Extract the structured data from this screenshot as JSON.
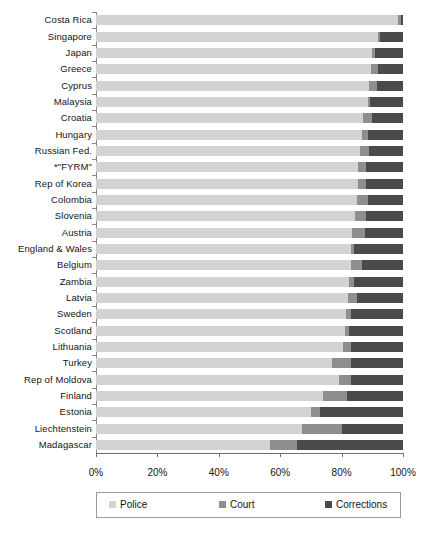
{
  "chart_data": {
    "type": "bar",
    "orientation": "horizontal",
    "stacked": true,
    "normalized": true,
    "title": "",
    "xlabel": "",
    "ylabel": "",
    "xlim": [
      0,
      100
    ],
    "grid": false,
    "legend_position": "bottom",
    "x_tick_labels": [
      "0%",
      "20%",
      "40%",
      "60%",
      "80%",
      "100%"
    ],
    "x_tick_values": [
      0,
      20,
      40,
      60,
      80,
      100
    ],
    "categories": [
      "Costa Rica",
      "Singapore",
      "Japan",
      "Greece",
      "Cyprus",
      "Malaysia",
      "Croatia",
      "Hungary",
      "Russian Fed.",
      "*\"FYRM\"",
      "Rep of Korea",
      "Colombia",
      "Slovenia",
      "Austria",
      "England & Wales",
      "Belgium",
      "Zambia",
      "Latvia",
      "Sweden",
      "Scotland",
      "Lithuania",
      "Turkey",
      "Rep of Moldova",
      "Finland",
      "Estonia",
      "Liechtenstein",
      "Madagascar"
    ],
    "series": [
      {
        "name": "Police",
        "color": "#d3d3d3",
        "values": [
          98.5,
          91.9,
          90.0,
          89.5,
          89.0,
          88.5,
          87.0,
          86.5,
          86.0,
          85.5,
          85.5,
          85.0,
          84.5,
          83.5,
          83.0,
          83.0,
          82.5,
          82.0,
          81.5,
          81.0,
          80.5,
          77.0,
          79.0,
          74.0,
          70.0,
          67.1,
          56.7
        ]
      },
      {
        "name": "Court",
        "color": "#8e8e8e",
        "values": [
          0.8,
          0.6,
          0.8,
          2.5,
          2.5,
          0.8,
          3.0,
          2.0,
          3.0,
          2.5,
          2.5,
          3.5,
          3.5,
          4.0,
          1.0,
          3.5,
          1.5,
          3.0,
          1.5,
          1.5,
          2.5,
          6.0,
          4.0,
          7.7,
          3.0,
          12.9,
          8.8
        ]
      },
      {
        "name": "Corrections",
        "color": "#4a4a4a",
        "values": [
          0.7,
          7.5,
          9.2,
          8.0,
          8.5,
          10.7,
          10.0,
          11.5,
          11.0,
          12.0,
          12.0,
          11.5,
          12.0,
          12.5,
          16.0,
          13.5,
          16.0,
          15.0,
          17.0,
          17.5,
          17.0,
          17.0,
          17.0,
          18.3,
          27.0,
          20.0,
          34.5
        ]
      }
    ],
    "legend": [
      {
        "label": "Police",
        "color": "#d3d3d3",
        "icon": "legend-swatch-police"
      },
      {
        "label": "Court",
        "color": "#8e8e8e",
        "icon": "legend-swatch-court"
      },
      {
        "label": "Corrections",
        "color": "#4a4a4a",
        "icon": "legend-swatch-corrections"
      }
    ]
  }
}
